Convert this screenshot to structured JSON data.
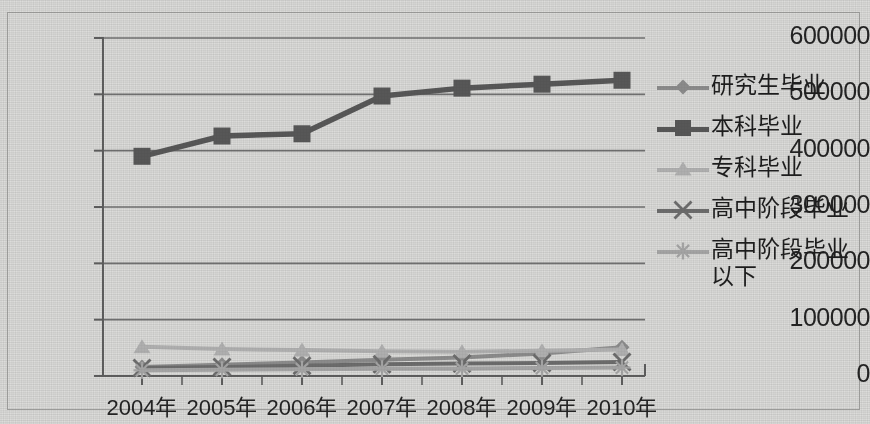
{
  "chart_data": {
    "type": "line",
    "title": "",
    "xlabel": "",
    "ylabel": "",
    "categories": [
      "2004年",
      "2005年",
      "2006年",
      "2007年",
      "2008年",
      "2009年",
      "2010年"
    ],
    "ylim": [
      0,
      600000
    ],
    "ytick_labels": [
      "0",
      "100000",
      "200000",
      "300000",
      "400000",
      "500000",
      "600000"
    ],
    "ytick_values": [
      0,
      100000,
      200000,
      300000,
      400000,
      500000,
      600000
    ],
    "grid": true,
    "legend_position": "right",
    "series": [
      {
        "name": "研究生毕业",
        "marker": "diamond",
        "color": "#8a8a8a",
        "values": [
          16000,
          20000,
          24000,
          29000,
          33000,
          40000,
          51000
        ]
      },
      {
        "name": "本科毕业",
        "marker": "square",
        "color": "#575757",
        "values": [
          390000,
          426000,
          430000,
          497000,
          511000,
          518000,
          525000
        ]
      },
      {
        "name": "专科毕业",
        "marker": "triangle",
        "color": "#aeaeae",
        "values": [
          52000,
          48000,
          46000,
          44000,
          43000,
          45000,
          47000
        ]
      },
      {
        "name": "高中阶段毕业",
        "marker": "cross",
        "color": "#6b6b6b",
        "values": [
          14000,
          16000,
          18000,
          21000,
          22000,
          23000,
          25000
        ]
      },
      {
        "name": "高中阶段毕业以下",
        "marker": "star",
        "color": "#a3a3a3",
        "values": [
          10000,
          11000,
          12000,
          13000,
          13000,
          14000,
          15000
        ]
      }
    ]
  },
  "axes": {
    "axis_color": "#5d5d5d",
    "grid_color": "#6f6f6f",
    "plot_bg": "#d8d8d6"
  }
}
